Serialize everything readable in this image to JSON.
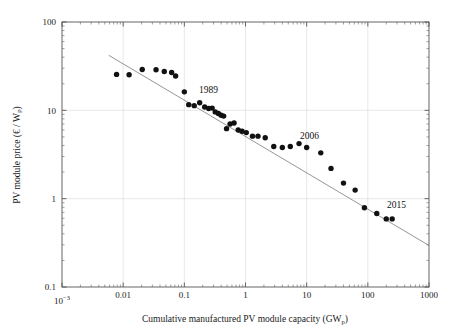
{
  "figure": {
    "background_color": "#ffffff",
    "point_color": "#111111",
    "line_color": "#8a8a8a",
    "grid_color": "#d9d9d9",
    "axis_color": "#555555"
  },
  "chart_data": {
    "type": "scatter",
    "title": "",
    "xlabel": "Cumulative manufactured PV module capacity (GW_p)",
    "xlabel_parts": {
      "main": "Cumulative manufactured PV module capacity (GW",
      "sub": "p",
      "tail": ")"
    },
    "ylabel": "PV module price (€ / W_P)",
    "ylabel_parts": {
      "main": "PV module price (€ / W",
      "sub": "P",
      "tail": ")"
    },
    "xscale": "log",
    "yscale": "log",
    "xlim": [
      0.001,
      1000
    ],
    "ylim": [
      0.1,
      100
    ],
    "grid": true,
    "legend": "none",
    "xticks": [
      {
        "value": 0.001,
        "label": "10",
        "sup": "−3"
      },
      {
        "value": 0.01,
        "label": "0.01",
        "sup": ""
      },
      {
        "value": 0.1,
        "label": "0.1",
        "sup": ""
      },
      {
        "value": 1,
        "label": "1",
        "sup": ""
      },
      {
        "value": 10,
        "label": "10",
        "sup": ""
      },
      {
        "value": 100,
        "label": "100",
        "sup": ""
      },
      {
        "value": 1000,
        "label": "1000",
        "sup": ""
      }
    ],
    "yticks": [
      {
        "value": 0.1,
        "label": "0.1"
      },
      {
        "value": 1,
        "label": "1"
      },
      {
        "value": 10,
        "label": "10"
      },
      {
        "value": 100,
        "label": "100"
      }
    ],
    "series": [
      {
        "name": "PV module price vs cumulative capacity",
        "marker": "filled-circle",
        "points": [
          [
            0.0078,
            25.5
          ],
          [
            0.0125,
            25.3
          ],
          [
            0.0205,
            29.0
          ],
          [
            0.0345,
            28.8
          ],
          [
            0.047,
            27.5
          ],
          [
            0.062,
            26.8
          ],
          [
            0.072,
            24.5
          ],
          [
            0.1,
            16.2
          ],
          [
            0.118,
            11.6
          ],
          [
            0.145,
            11.3
          ],
          [
            0.178,
            12.2
          ],
          [
            0.215,
            10.9
          ],
          [
            0.25,
            10.5
          ],
          [
            0.285,
            10.6
          ],
          [
            0.32,
            9.6
          ],
          [
            0.36,
            9.2
          ],
          [
            0.4,
            8.8
          ],
          [
            0.44,
            8.6
          ],
          [
            0.49,
            6.2
          ],
          [
            0.56,
            7.0
          ],
          [
            0.65,
            7.2
          ],
          [
            0.76,
            6.0
          ],
          [
            0.88,
            5.8
          ],
          [
            1.03,
            5.6
          ],
          [
            1.3,
            5.1
          ],
          [
            1.6,
            5.1
          ],
          [
            2.1,
            4.9
          ],
          [
            2.9,
            3.9
          ],
          [
            4.0,
            3.8
          ],
          [
            5.4,
            3.9
          ],
          [
            7.5,
            4.2
          ],
          [
            10.0,
            3.8
          ],
          [
            17.0,
            3.3
          ],
          [
            25.0,
            2.2
          ],
          [
            40.0,
            1.5
          ],
          [
            62.0,
            1.25
          ],
          [
            88.0,
            0.79
          ],
          [
            140.0,
            0.68
          ],
          [
            200.0,
            0.59
          ],
          [
            250.0,
            0.59
          ]
        ]
      }
    ],
    "trendline": {
      "name": "experience-curve fit",
      "x_start": 0.0058,
      "y_start": 42.0,
      "x_end": 1000.0,
      "y_end": 0.295
    },
    "annotations": [
      {
        "label": "1989",
        "x_px": 199,
        "y_px": 93,
        "anchor": "start"
      },
      {
        "label": "2006",
        "x_px": 300,
        "y_px": 139,
        "anchor": "start"
      },
      {
        "label": "2015",
        "x_px": 387,
        "y_px": 208,
        "anchor": "start"
      }
    ]
  }
}
